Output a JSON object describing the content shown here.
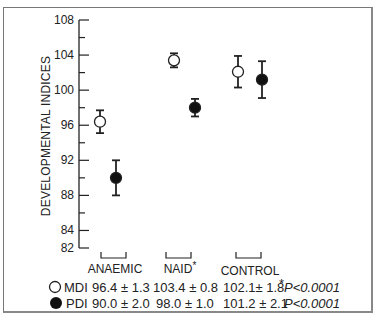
{
  "chart_data": {
    "type": "scatter",
    "subtype": "error-bar",
    "title": "",
    "xlabel": "",
    "ylabel": "DEVELOPMENTAL INDICES",
    "ylim": [
      82,
      108
    ],
    "y_ticks_major": [
      82,
      84,
      88,
      92,
      96,
      100,
      104,
      108
    ],
    "y_tick_labels": [
      "82",
      "84",
      "88",
      "92",
      "96",
      "100",
      "104",
      "108"
    ],
    "y_minor_step": 2,
    "grid": false,
    "categories": [
      "ANAEMIC",
      "NAID*",
      "CONTROL"
    ],
    "series": [
      {
        "name": "MDI",
        "marker": "open-circle",
        "values": [
          96.4,
          103.4,
          102.1
        ],
        "errors": [
          1.3,
          0.8,
          1.8
        ]
      },
      {
        "name": "PDI",
        "marker": "filled-circle",
        "values": [
          90.0,
          98.0,
          101.2
        ],
        "errors": [
          2.0,
          1.0,
          2.1
        ]
      }
    ],
    "legend_table": {
      "rows": [
        {
          "symbol": "open-circle",
          "label": "MDI",
          "cells": [
            "96.4 ± 1.3",
            "103.4 ± 0.8",
            "102.1± 1.8"
          ],
          "p_prefix": "*",
          "p_value": "P<0.0001"
        },
        {
          "symbol": "filled-circle",
          "label": "PDI",
          "cells": [
            "90.0 ± 2.0",
            "98.0 ± 1.0",
            "101.2 ± 2.1"
          ],
          "p_prefix": "",
          "p_value": "P<0.0001"
        }
      ]
    },
    "annotations": [
      "* marks NAID group; *P<0.0001"
    ],
    "legend_position": "bottom"
  },
  "axis": {
    "ylabel": "DEVELOPMENTAL INDICES",
    "ticks": [
      "108",
      "104",
      "100",
      "96",
      "92",
      "88",
      "84",
      "82"
    ]
  },
  "groups": {
    "g0": "ANAEMIC",
    "g1": "NAID",
    "g1_mark": "*",
    "g2": "CONTROL"
  },
  "table": {
    "mdi_label": "MDI",
    "pdi_label": "PDI",
    "mdi_0": "96.4 ± 1.3",
    "mdi_1": "103.4 ± 0.8",
    "mdi_2": "102.1± 1.8",
    "pdi_0": "90.0 ± 2.0",
    "pdi_1": "98.0 ± 1.0",
    "pdi_2": "101.2 ± 2.1",
    "mdi_star": "*",
    "mdi_p": "P<0.0001",
    "pdi_p": "P<0.0001"
  }
}
